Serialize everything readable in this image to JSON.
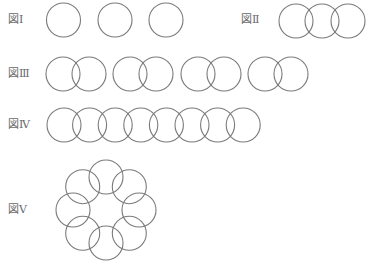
{
  "labels": {
    "fig1": "図Ⅰ",
    "fig2": "図Ⅱ",
    "fig3": "図Ⅲ",
    "fig4": "図Ⅳ",
    "fig5": "図Ⅴ"
  },
  "figures": [
    {
      "id": "fig1",
      "description": "3 separate circles",
      "circle_count": 3,
      "arrangement": "separate"
    },
    {
      "id": "fig2",
      "description": "3 circles in a chain, overlapping",
      "circle_count": 3,
      "arrangement": "chain"
    },
    {
      "id": "fig3",
      "description": "4 pairs of overlapping circles",
      "circle_count": 8,
      "arrangement": "pairs"
    },
    {
      "id": "fig4",
      "description": "8 circles in a chain, overlapping",
      "circle_count": 8,
      "arrangement": "chain"
    },
    {
      "id": "fig5",
      "description": "8 circles arranged in a ring, each overlapping its neighbors",
      "circle_count": 8,
      "arrangement": "ring"
    }
  ],
  "style": {
    "stroke": "#7a7a7a",
    "label_color": "#6a6a6a"
  }
}
